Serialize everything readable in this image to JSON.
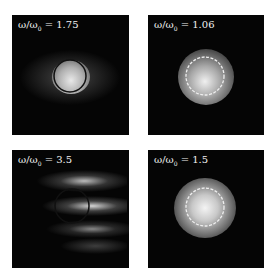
{
  "figure": {
    "panels": [
      {
        "id": "top-left",
        "label_prefix": "ω/ω",
        "label_sub": "0",
        "label_value": " = 1.75",
        "ring_style": "solid",
        "ring_color": "#111111",
        "ring_cx": 58,
        "ring_cy": 61,
        "ring_r": 16,
        "pattern": "bright blob with horizontal fringes"
      },
      {
        "id": "top-right",
        "label_prefix": "ω/ω",
        "label_sub": "0",
        "label_value": " = 1.06",
        "ring_style": "dashed",
        "ring_color": "#eeeeee",
        "ring_cx": 57,
        "ring_cy": 61,
        "ring_r": 19,
        "pattern": "compact round spot"
      },
      {
        "id": "bottom-left",
        "label_prefix": "ω/ω",
        "label_sub": "0",
        "label_value": " = 3.5",
        "ring_style": "solid",
        "ring_color": "#111111",
        "ring_cx": 60,
        "ring_cy": 56,
        "ring_r": 17,
        "pattern": "striped horizontal bands"
      },
      {
        "id": "bottom-right",
        "label_prefix": "ω/ω",
        "label_sub": "0",
        "label_value": " = 1.5",
        "ring_style": "dashed",
        "ring_color": "#eeeeee",
        "ring_cx": 57,
        "ring_cy": 57,
        "ring_r": 19,
        "pattern": "round bright spot"
      }
    ]
  }
}
